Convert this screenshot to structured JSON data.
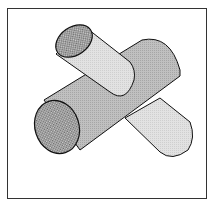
{
  "figure": {
    "cylinders": [
      {
        "name": "front-large-cylinder",
        "fill": "#b8b8b8",
        "end_cap_fill": "#8a8a8a"
      },
      {
        "name": "back-small-cylinder",
        "fill": "#dcdcdc",
        "end_cap_fill": "#8a8a8a"
      }
    ],
    "frame_color": "#333333",
    "outline_color": "#111111"
  }
}
